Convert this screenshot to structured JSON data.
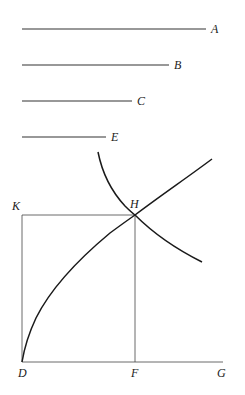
{
  "diagram": {
    "type": "geometric construction (mean proportionals via parabola and hyperbola)",
    "segments": [
      {
        "label": "A",
        "x1": 22,
        "x2": 206,
        "y": 29
      },
      {
        "label": "B",
        "x1": 22,
        "x2": 169,
        "y": 65
      },
      {
        "label": "C",
        "x1": 22,
        "x2": 132,
        "y": 101
      },
      {
        "label": "E",
        "x1": 22,
        "x2": 106,
        "y": 137
      }
    ],
    "points": {
      "K": {
        "label": "K",
        "x": 22,
        "y": 215
      },
      "H": {
        "label": "H",
        "x": 135,
        "y": 215
      },
      "D": {
        "label": "D",
        "x": 22,
        "y": 362
      },
      "F": {
        "label": "F",
        "x": 135,
        "y": 362
      },
      "G": {
        "label": "G",
        "x": 222,
        "y": 362
      }
    },
    "curves": [
      {
        "name": "parabola",
        "from": "D",
        "through": "H",
        "to": [
          212,
          159
        ]
      },
      {
        "name": "hyperbola",
        "from": [
          98,
          152
        ],
        "through": "H",
        "to": [
          202,
          262
        ]
      }
    ],
    "rectangle": [
      "K",
      "H",
      "F",
      "D"
    ],
    "axis": {
      "from": "D",
      "to": "G"
    }
  }
}
